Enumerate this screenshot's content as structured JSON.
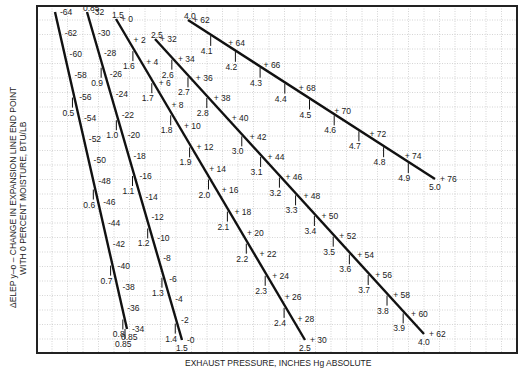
{
  "chart_data": {
    "type": "line",
    "title": "",
    "ylabel_line1": "ΔELEP y–o – CHANGE IN EXPANSION LINE END POINT",
    "ylabel_line2": "WITH 0 PERCENT MOISTURE, BTU/LB",
    "xlabel": "EXHAUST PRESSURE, INCHES Hg ABSOLUTE",
    "grid": true,
    "legend": null,
    "series": [
      {
        "name": "0.5 to 0.85 in Hg",
        "start": [
          55,
          12
        ],
        "end": [
          127,
          329
        ],
        "pressure_ticks": [
          "0.5",
          "0.6",
          "0.7",
          "0.8",
          "0.85"
        ],
        "pressure_tick_t": [
          0.27,
          0.56,
          0.8,
          0.97,
          1.0
        ],
        "values": [
          -64,
          -62,
          -60,
          -58,
          -56,
          -54,
          -52,
          -50,
          -48,
          -46,
          -44,
          -42,
          -40,
          -38,
          -36,
          -34
        ],
        "top_label": "",
        "end_label": "0.85"
      },
      {
        "name": "0.85 to 1.5 in Hg",
        "start": [
          87,
          12
        ],
        "end": [
          182,
          340
        ],
        "pressure_ticks": [
          "0.9",
          "1.0",
          "1.1",
          "1.2",
          "1.3",
          "1.4"
        ],
        "pressure_tick_t": [
          0.17,
          0.33,
          0.5,
          0.66,
          0.81,
          0.95
        ],
        "values": [
          -32,
          -30,
          -28,
          -26,
          -24,
          -22,
          -20,
          -18,
          -16,
          -14,
          -12,
          -10,
          -8,
          -6,
          -4,
          -2,
          0
        ],
        "top_label": "0.85",
        "end_label": "1.5"
      },
      {
        "name": "1.5 to 2.5 in Hg",
        "start": [
          116,
          19
        ],
        "end": [
          305,
          340
        ],
        "pressure_ticks": [
          "1.6",
          "1.7",
          "1.8",
          "1.9",
          "2.0",
          "2.1",
          "2.2",
          "2.3",
          "2.4"
        ],
        "pressure_tick_t": [
          0.1,
          0.2,
          0.3,
          0.4,
          0.5,
          0.6,
          0.7,
          0.8,
          0.9
        ],
        "values": [
          0,
          2,
          4,
          6,
          8,
          10,
          12,
          14,
          16,
          18,
          20,
          22,
          24,
          26,
          28,
          30
        ],
        "top_label": "1.5",
        "end_label": "2.5"
      },
      {
        "name": "2.5 to 4.0 in Hg",
        "start": [
          155,
          39
        ],
        "end": [
          424,
          334
        ],
        "pressure_ticks": [
          "2.6",
          "2.7",
          "2.8",
          "3.0",
          "3.1",
          "3.2",
          "3.3",
          "3.4",
          "3.5",
          "3.6",
          "3.7",
          "3.8",
          "3.9"
        ],
        "pressure_tick_t": [
          0.07,
          0.13,
          0.2,
          0.33,
          0.4,
          0.47,
          0.53,
          0.6,
          0.67,
          0.73,
          0.8,
          0.87,
          0.93
        ],
        "values": [
          32,
          34,
          36,
          38,
          40,
          42,
          44,
          46,
          48,
          50,
          52,
          54,
          56,
          58,
          60,
          62
        ],
        "top_label": "2.5",
        "end_label": "4.0"
      },
      {
        "name": "4.0 to 5.0 in Hg",
        "start": [
          188,
          20
        ],
        "end": [
          435,
          179
        ],
        "pressure_ticks": [
          "4.1",
          "4.2",
          "4.3",
          "4.4",
          "4.5",
          "4.6",
          "4.7",
          "4.8",
          "4.9"
        ],
        "pressure_tick_t": [
          0.1,
          0.2,
          0.3,
          0.4,
          0.5,
          0.6,
          0.7,
          0.8,
          0.9
        ],
        "values": [
          62,
          64,
          66,
          68,
          70,
          72,
          74,
          76
        ],
        "top_label": "4.0",
        "end_label": "5.0"
      }
    ],
    "frame": {
      "left": 37,
      "top": 6,
      "right": 517,
      "bottom": 353
    },
    "colors": {
      "line": "#111111",
      "grid": "#b8b8b8",
      "text": "#222222",
      "frame": "#222222"
    }
  }
}
